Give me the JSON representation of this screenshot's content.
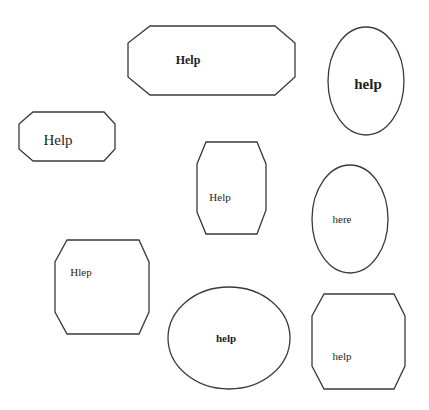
{
  "diagram": {
    "background": "#ffffff",
    "stroke_color": "#3a3a3a",
    "shapes": [
      {
        "id": "A",
        "kind": "octagon",
        "points": "150,26 275,26 295,43 295,77 275,95 150,95 128,77 128,43",
        "label": "Help",
        "label_x": 188,
        "label_y": 60,
        "font_size": 12,
        "bold": true
      },
      {
        "id": "B",
        "kind": "ellipse",
        "cx": 366,
        "cy": 81,
        "rx": 38,
        "ry": 54,
        "label": "help",
        "label_x": 368,
        "label_y": 84,
        "font_size": 15,
        "bold": true
      },
      {
        "id": "C",
        "kind": "octagon",
        "points": "33,112 104,112 115,124 115,149 104,161 33,161 19,149 19,124",
        "label": "Help",
        "label_x": 58,
        "label_y": 140,
        "font_size": 15,
        "bold": false
      },
      {
        "id": "D",
        "kind": "octagon",
        "points": "206,142 257,142 266,164 266,210 257,234 206,234 197,212 197,164",
        "label": "Help",
        "label_x": 220,
        "label_y": 197,
        "font_size": 11,
        "bold": false
      },
      {
        "id": "E",
        "kind": "ellipse",
        "cx": 350,
        "cy": 219,
        "rx": 38,
        "ry": 54,
        "label": "here",
        "label_x": 342,
        "label_y": 219,
        "font_size": 11,
        "bold": false
      },
      {
        "id": "F",
        "kind": "octagon",
        "points": "67,240 139,240 149,262 149,312 139,334 67,334 55,312 55,262",
        "label": "Hlep",
        "label_x": 81,
        "label_y": 272,
        "font_size": 11,
        "bold": false
      },
      {
        "id": "G",
        "kind": "ellipse",
        "cx": 229,
        "cy": 338,
        "rx": 61,
        "ry": 51,
        "label": "help",
        "label_x": 226,
        "label_y": 338,
        "font_size": 11,
        "bold": true
      },
      {
        "id": "H",
        "kind": "octagon",
        "points": "324,294 394,294 405,316 405,366 394,389 324,389 312,366 312,316",
        "label": "help",
        "label_x": 342,
        "label_y": 356,
        "font_size": 11,
        "bold": false
      }
    ]
  }
}
